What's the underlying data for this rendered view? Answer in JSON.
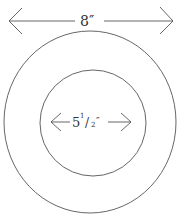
{
  "diagram": {
    "outer": {
      "label": "8″",
      "cx": 90,
      "cy": 121,
      "rx": 86,
      "ry": 91
    },
    "inner": {
      "label_main": "5",
      "label_frac_num": "1",
      "label_frac_slash": "/",
      "label_frac_den": "2",
      "label_unit": "″",
      "cx": 93,
      "cy": 123,
      "r": 53
    },
    "stroke_color": "#555555"
  }
}
